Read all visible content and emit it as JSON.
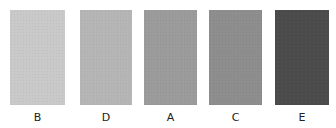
{
  "swatches": [
    {
      "label": "B",
      "color": "#c9c9c9",
      "x": 10,
      "width": 55
    },
    {
      "label": "D",
      "color": "#b5b5b5",
      "x": 80,
      "width": 52
    },
    {
      "label": "A",
      "color": "#9b9b9b",
      "x": 144,
      "width": 53
    },
    {
      "label": "C",
      "color": "#8d8d8d",
      "x": 209,
      "width": 53
    },
    {
      "label": "E",
      "color": "#4b4b4b",
      "x": 275,
      "width": 54
    }
  ]
}
